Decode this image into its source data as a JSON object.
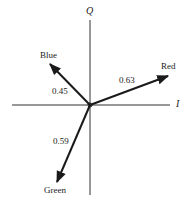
{
  "diagram": {
    "type": "vector-diagram",
    "axes": {
      "vertical": {
        "label": "Q"
      },
      "horizontal": {
        "label": "I"
      }
    },
    "vectors": [
      {
        "name": "Blue",
        "magnitude": "0.45"
      },
      {
        "name": "Red",
        "magnitude": "0.63"
      },
      {
        "name": "Green",
        "magnitude": "0.59"
      }
    ],
    "colors": {
      "stroke": "#1a1a1a",
      "background": "#ffffff"
    }
  }
}
